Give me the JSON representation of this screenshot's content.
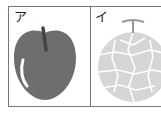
{
  "panels": [
    {
      "label": "ア",
      "subject": "apple",
      "color": "#6e6e6e"
    },
    {
      "label": "イ",
      "subject": "melon",
      "color": "#d4d4d4"
    }
  ],
  "colors": {
    "border": "#777777",
    "apple": "#6e6e6e",
    "melon": "#d6d6d6",
    "net": "#ffffff"
  }
}
